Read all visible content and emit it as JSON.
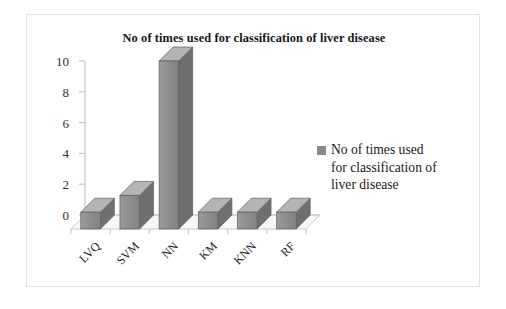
{
  "chart_data": {
    "type": "bar",
    "title": "No of times used for classification of liver disease",
    "categories": [
      "LVQ",
      "SVM",
      "NN",
      "KM",
      "KNN",
      "RF"
    ],
    "values": [
      1,
      2,
      10,
      1,
      1,
      1
    ],
    "series": [
      {
        "name": "No of times used for classification of liver disease",
        "values": [
          1,
          2,
          10,
          1,
          1,
          1
        ]
      }
    ],
    "xlabel": "",
    "ylabel": "",
    "ylim": [
      0,
      10
    ],
    "yticks": [
      0,
      2,
      4,
      6,
      8,
      10
    ],
    "ytick_labels": [
      "0",
      "2",
      "4",
      "6",
      "8",
      "10"
    ],
    "grid": false,
    "legend_position": "right",
    "legend_entries": [
      "No of times used for classification of liver disease"
    ],
    "legend_lines": [
      "No of times used",
      "for classification of",
      "liver disease"
    ],
    "style": "3d-column",
    "bar_color": "#8a8a8a",
    "floor_color": "#f2f2f2",
    "axis_color": "#b0b0b0"
  },
  "legend": {
    "marker_color": "#8a8a8a",
    "line1": "No of times used",
    "line2": "for classification of",
    "line3": "liver disease"
  }
}
